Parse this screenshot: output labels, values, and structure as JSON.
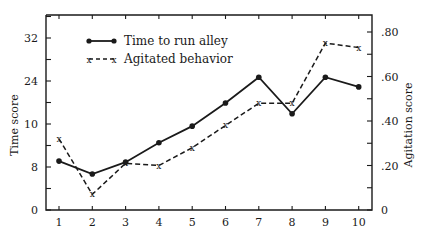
{
  "chart_data": {
    "type": "line",
    "title": "",
    "xlabel": "",
    "x": [
      1,
      2,
      3,
      4,
      5,
      6,
      7,
      8,
      9,
      10
    ],
    "x_ticks": [
      "1",
      "2",
      "3",
      "4",
      "5",
      "6",
      "7",
      "8",
      "9",
      "10"
    ],
    "left_axis": {
      "label": "Time score",
      "ticks": [
        {
          "value": 0,
          "label": "0"
        },
        {
          "value": 8,
          "label": "8"
        },
        {
          "value": 16,
          "label": "10"
        },
        {
          "value": 24,
          "label": "24"
        },
        {
          "value": 32,
          "label": "32"
        }
      ],
      "ylim": [
        0,
        36
      ]
    },
    "right_axis": {
      "label": "Agitation score",
      "ticks": [
        {
          "value": 0,
          "label": "0"
        },
        {
          "value": 0.2,
          "label": ".20"
        },
        {
          "value": 0.4,
          "label": ".40"
        },
        {
          "value": 0.6,
          "label": ".60"
        },
        {
          "value": 0.8,
          "label": ".80"
        }
      ],
      "ylim": [
        0,
        0.8
      ]
    },
    "series": [
      {
        "name": "Time to run alley",
        "axis": "left",
        "style": "solid",
        "marker": "dot",
        "values": [
          9.1,
          6.7,
          8.9,
          12.5,
          15.6,
          19.9,
          24.7,
          17.9,
          24.7,
          22.9
        ]
      },
      {
        "name": "Agitated behavior",
        "axis": "right",
        "style": "dashed",
        "marker": "x",
        "values": [
          0.32,
          0.07,
          0.21,
          0.2,
          0.28,
          0.38,
          0.48,
          0.48,
          0.75,
          0.73
        ]
      }
    ],
    "legend": {
      "position": "upper-left-inside",
      "entries": [
        "Time to run alley",
        "Agitated behavior"
      ]
    },
    "grid": false
  }
}
